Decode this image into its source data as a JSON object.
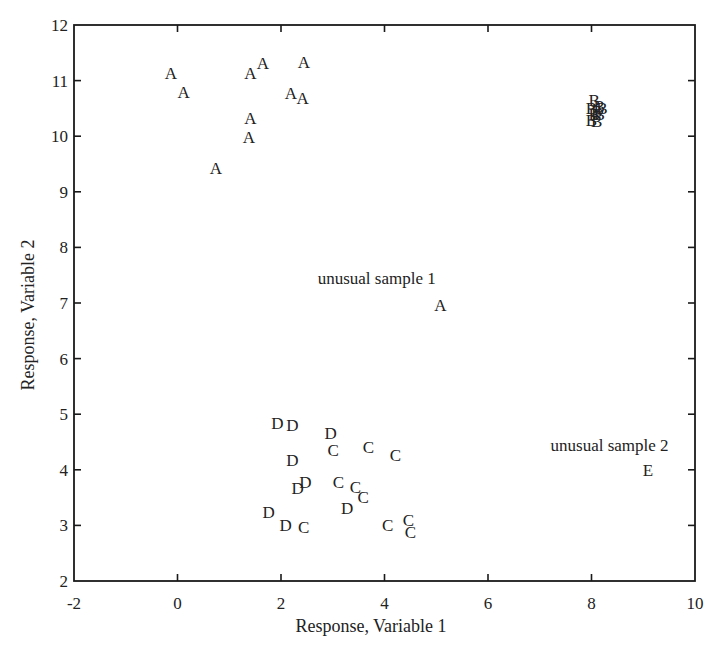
{
  "chart_data": {
    "type": "scatter",
    "title": "",
    "xlabel": "Response, Variable 1",
    "ylabel": "Response, Variable 2",
    "xlim": [
      -2,
      10
    ],
    "ylim": [
      2,
      12
    ],
    "xticks": [
      -2,
      0,
      2,
      4,
      6,
      8,
      10
    ],
    "yticks": [
      2,
      3,
      4,
      5,
      6,
      7,
      8,
      9,
      10,
      11,
      12
    ],
    "grid": false,
    "legend": "none (points plotted as class letters)",
    "marker_style": "letter labels",
    "series": [
      {
        "name": "A",
        "points": [
          [
            -0.13,
            11.14
          ],
          [
            0.12,
            10.8
          ],
          [
            1.41,
            11.14
          ],
          [
            1.65,
            11.32
          ],
          [
            2.44,
            11.33
          ],
          [
            2.19,
            10.78
          ],
          [
            2.42,
            10.69
          ],
          [
            1.41,
            10.33
          ],
          [
            1.38,
            9.99
          ],
          [
            0.74,
            9.43
          ],
          [
            5.08,
            6.96
          ]
        ]
      },
      {
        "name": "B",
        "points": [
          [
            8.05,
            10.65
          ],
          [
            8.15,
            10.55
          ],
          [
            8.0,
            10.5
          ],
          [
            8.2,
            10.5
          ],
          [
            8.1,
            10.45
          ],
          [
            8.05,
            10.4
          ],
          [
            8.15,
            10.4
          ],
          [
            8.0,
            10.3
          ],
          [
            8.1,
            10.28
          ]
        ]
      },
      {
        "name": "C",
        "points": [
          [
            3.01,
            4.36
          ],
          [
            3.69,
            4.41
          ],
          [
            4.21,
            4.27
          ],
          [
            3.11,
            3.78
          ],
          [
            3.44,
            3.69
          ],
          [
            3.59,
            3.51
          ],
          [
            2.44,
            2.97
          ],
          [
            4.06,
            3.01
          ],
          [
            4.46,
            3.1
          ],
          [
            4.5,
            2.88
          ]
        ]
      },
      {
        "name": "D",
        "points": [
          [
            1.93,
            4.84
          ],
          [
            2.22,
            4.81
          ],
          [
            2.96,
            4.66
          ],
          [
            2.22,
            4.18
          ],
          [
            2.47,
            3.78
          ],
          [
            2.32,
            3.67
          ],
          [
            3.28,
            3.31
          ],
          [
            1.76,
            3.24
          ],
          [
            2.09,
            3.01
          ]
        ]
      },
      {
        "name": "E",
        "points": [
          [
            9.09,
            4.0
          ]
        ]
      }
    ],
    "annotations": [
      {
        "text": "unusual sample 1",
        "x": 3.85,
        "y": 7.45,
        "refers_to": "A at (5.08, 6.96)"
      },
      {
        "text": "unusual sample 2",
        "x": 8.35,
        "y": 4.45,
        "refers_to": "E at (9.09, 4.00)"
      }
    ]
  },
  "colors": {
    "ink": "#222222",
    "axis": "#1a1a1a",
    "background": "#ffffff"
  }
}
